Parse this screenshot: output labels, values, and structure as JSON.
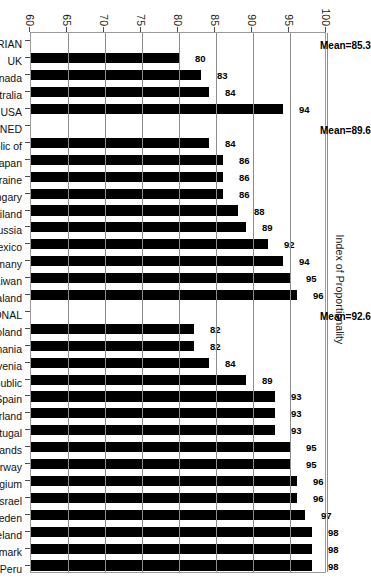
{
  "chart_data": {
    "type": "bar",
    "title": "",
    "subtitle": "",
    "xlabel": "",
    "ylabel": "Index of Proportionality",
    "ylim": [
      60,
      100
    ],
    "yticks": [
      60,
      65,
      70,
      75,
      80,
      85,
      90,
      95,
      100
    ],
    "grid": true,
    "legend": null,
    "orientation": "vertical-rotated-90",
    "bar_color": "#000000",
    "categories": [
      "MAJORITARIAN",
      "UK",
      "Canada",
      "Australia",
      "USA",
      "COMBINED",
      "Korea, Republic of",
      "Japan",
      "Ukraine",
      "Hungary",
      "Thailand",
      "Russia",
      "Mexico",
      "Germany",
      "Taiwan",
      "New Zealand",
      "PROPORTIONAL",
      "Poland",
      "Romania",
      "Slovenia",
      "Czech Republic",
      "Spain",
      "Switzerland",
      "Portugal",
      "Netherlands",
      "Norway",
      "Belgium",
      "Israel",
      "Sweden",
      "Iceland",
      "Denmark",
      "Peru"
    ],
    "values": [
      null,
      80,
      83,
      84,
      94,
      null,
      84,
      86,
      86,
      86,
      88,
      89,
      92,
      94,
      95,
      96,
      null,
      82,
      82,
      84,
      89,
      93,
      93,
      93,
      95,
      95,
      96,
      96,
      97,
      98,
      98,
      98
    ],
    "data_labels": [
      "",
      "80",
      "83",
      "84",
      "94",
      "",
      "84",
      "86",
      "86",
      "86",
      "88",
      "89",
      "92",
      "94",
      "95",
      "96",
      "",
      "82",
      "82",
      "84",
      "89",
      "93",
      "93",
      "93",
      "95",
      "95",
      "96",
      "96",
      "97",
      "98",
      "98",
      "98"
    ],
    "groups": [
      {
        "name": "MAJORITARIAN",
        "header_index": 0,
        "mean_label": "Mean=85.3",
        "mean": 85.3,
        "members": [
          "UK",
          "Canada",
          "Australia",
          "USA"
        ]
      },
      {
        "name": "COMBINED",
        "header_index": 5,
        "mean_label": "Mean=89.6",
        "mean": 89.6,
        "members": [
          "Korea, Republic of",
          "Japan",
          "Ukraine",
          "Hungary",
          "Thailand",
          "Russia",
          "Mexico",
          "Germany",
          "Taiwan",
          "New Zealand"
        ]
      },
      {
        "name": "PROPORTIONAL",
        "header_index": 16,
        "mean_label": "Mean=92.6",
        "mean": 92.6,
        "members": [
          "Poland",
          "Romania",
          "Slovenia",
          "Czech Republic",
          "Spain",
          "Switzerland",
          "Portugal",
          "Netherlands",
          "Norway",
          "Belgium",
          "Israel",
          "Sweden",
          "Iceland",
          "Denmark",
          "Peru"
        ]
      }
    ]
  }
}
